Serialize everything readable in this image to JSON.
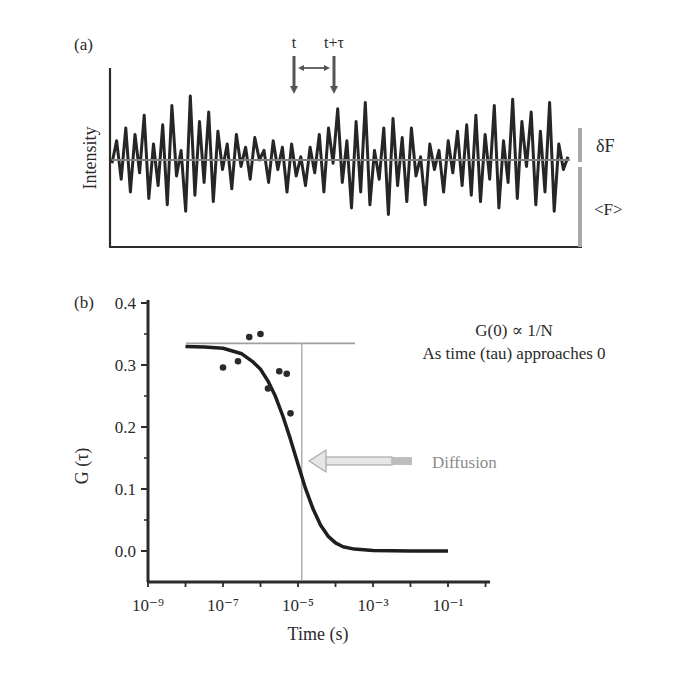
{
  "chart_data": [
    {
      "panel": "a",
      "type": "line",
      "panel_label": "(a)",
      "title": "",
      "ylabel": "Intensity",
      "xlabel": "",
      "grid": false,
      "annotations": {
        "t_label": "t",
        "t_tau_label": "t+τ",
        "delta_f_label": "δF",
        "mean_f_label": "<F>"
      },
      "description": "Fluctuating fluorescence intensity trace around a mean <F>, with deviation δF",
      "mean_level_relative": 0.5,
      "values": [
        0.48,
        0.62,
        0.38,
        0.7,
        0.3,
        0.66,
        0.42,
        0.78,
        0.26,
        0.6,
        0.34,
        0.72,
        0.22,
        0.84,
        0.4,
        0.56,
        0.18,
        0.9,
        0.28,
        0.74,
        0.36,
        0.8,
        0.24,
        0.68,
        0.44,
        0.6,
        0.32,
        0.66,
        0.46,
        0.58,
        0.38,
        0.64,
        0.5,
        0.56,
        0.36,
        0.62,
        0.44,
        0.58,
        0.3,
        0.6,
        0.4,
        0.52,
        0.34,
        0.58,
        0.42,
        0.66,
        0.3,
        0.7,
        0.48,
        0.82,
        0.36,
        0.62,
        0.2,
        0.74,
        0.3,
        0.86,
        0.22,
        0.56,
        0.38,
        0.7,
        0.16,
        0.76,
        0.34,
        0.64,
        0.24,
        0.7,
        0.4,
        0.52,
        0.22,
        0.6,
        0.44,
        0.56,
        0.3,
        0.62,
        0.42,
        0.68,
        0.34,
        0.72,
        0.28,
        0.78,
        0.24,
        0.66,
        0.38,
        0.84,
        0.2,
        0.62,
        0.36,
        0.88,
        0.26,
        0.74,
        0.46,
        0.8,
        0.22,
        0.68,
        0.3,
        0.86,
        0.18,
        0.6,
        0.44,
        0.52
      ]
    },
    {
      "panel": "b",
      "type": "line",
      "panel_label": "(b)",
      "title": "",
      "xlabel": "Time (s)",
      "ylabel": "G (τ)",
      "xscale": "log",
      "xlim_exp": [
        -9,
        0.1
      ],
      "ylim": [
        -0.04,
        0.4
      ],
      "x_ticks": [
        "10⁻⁹",
        "10⁻⁷",
        "10⁻⁵",
        "10⁻³",
        "10⁻¹"
      ],
      "x_tick_exponents": [
        -9,
        -7,
        -5,
        -3,
        -1
      ],
      "y_ticks": [
        "0.0",
        "0.1",
        "0.2",
        "0.3",
        "0.4"
      ],
      "y_tick_values": [
        0.0,
        0.1,
        0.2,
        0.3,
        0.4
      ],
      "grid": false,
      "annotations": {
        "g0_text": "G(0) ∝ 1/N",
        "g0_subtext": "As time (tau) approaches 0",
        "diffusion_label": "Diffusion",
        "g0_reference_level": 0.335,
        "diffusion_time_exp": -4.9
      },
      "series": [
        {
          "name": "fit",
          "g0": 0.33,
          "tau_d_exp": -5.0,
          "x_exp": [
            -8.0,
            -7.5,
            -7.0,
            -6.5,
            -6.2,
            -6.0,
            -5.8,
            -5.6,
            -5.4,
            -5.2,
            -5.0,
            -4.8,
            -4.6,
            -4.4,
            -4.2,
            -4.0,
            -3.8,
            -3.5,
            -3.0,
            -2.0,
            -1.0
          ],
          "y": [
            0.33,
            0.329,
            0.327,
            0.318,
            0.305,
            0.293,
            0.274,
            0.249,
            0.217,
            0.18,
            0.14,
            0.101,
            0.068,
            0.042,
            0.024,
            0.013,
            0.007,
            0.003,
            0.001,
            0.0,
            0.0
          ]
        },
        {
          "name": "data_points",
          "x_exp": [
            -7.0,
            -6.6,
            -6.3,
            -6.0,
            -5.8,
            -5.5,
            -5.3,
            -5.2
          ],
          "y": [
            0.296,
            0.306,
            0.345,
            0.35,
            0.262,
            0.29,
            0.286,
            0.222
          ]
        }
      ]
    }
  ]
}
